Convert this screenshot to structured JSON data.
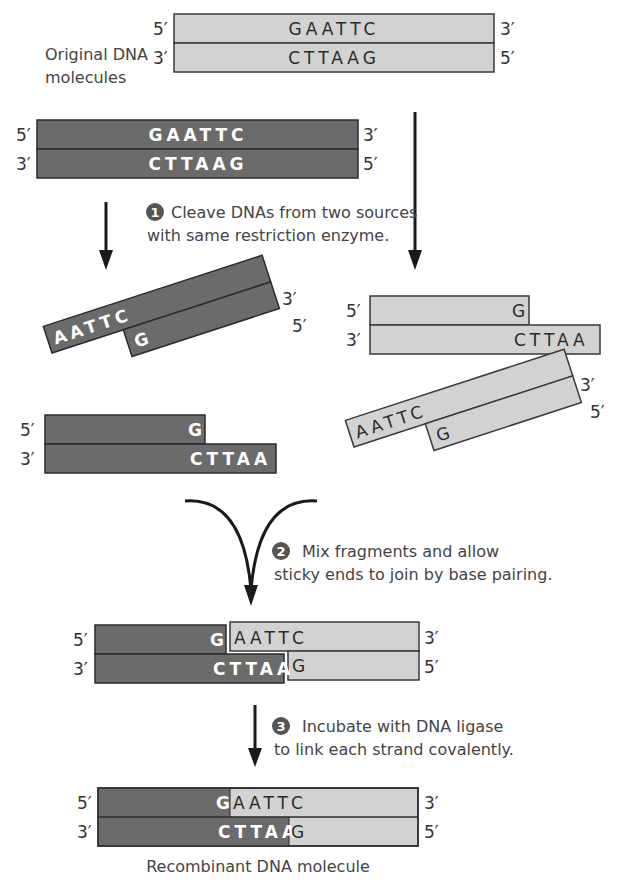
{
  "colors": {
    "dark_strand": "#6b6b6b",
    "light_strand": "#d2d2d2",
    "outline": "#2b2b2b",
    "arrow": "#1a1a1a",
    "text": "#333333",
    "step_badge": "#555555"
  },
  "labels": {
    "original": [
      "Original DNA",
      "molecules"
    ],
    "recombinant": "Recombinant DNA molecule",
    "five_prime": "5′",
    "three_prime": "3′"
  },
  "molecules": {
    "original_light": {
      "top": "GAATTC",
      "bottom": "CTTAAG"
    },
    "original_dark": {
      "top": "GAATTC",
      "bottom": "CTTAAG"
    },
    "dark_tilted_fragment": {
      "overhang": "AATTC",
      "paired": "G"
    },
    "dark_flat_fragment": {
      "top": "G",
      "bottom": "CTTAA"
    },
    "light_flat_fragment": {
      "top": "G",
      "bottom": "CTTAA"
    },
    "light_tilted_fragment": {
      "overhang": "AATTC",
      "paired": "G"
    },
    "annealed": {
      "dark_top": "G",
      "light_top": "AATTC",
      "dark_bottom": "CTTAA",
      "light_bottom": "G"
    },
    "recombinant": {
      "dark_top": "G",
      "light_top": "AATTC",
      "dark_bottom": "CTTAA",
      "light_bottom": "G"
    }
  },
  "steps": [
    {
      "number": "1",
      "lines": [
        "Cleave DNAs from two sources",
        "with same restriction enzyme."
      ]
    },
    {
      "number": "2",
      "lines": [
        "Mix fragments and allow",
        "sticky ends to join by base pairing."
      ]
    },
    {
      "number": "3",
      "lines": [
        "Incubate with DNA ligase",
        "to link each strand covalently."
      ]
    }
  ]
}
